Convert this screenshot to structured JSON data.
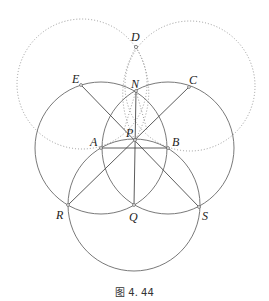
{
  "figure": {
    "caption": "图 4. 44",
    "points": {
      "D": {
        "label": "D",
        "x": 136,
        "y": 47
      },
      "E": {
        "label": "E",
        "x": 81,
        "y": 85
      },
      "N": {
        "label": "N",
        "x": 136,
        "y": 91
      },
      "C": {
        "label": "C",
        "x": 189,
        "y": 87
      },
      "P": {
        "label": "P",
        "x": 135,
        "y": 140
      },
      "A": {
        "label": "A",
        "x": 101,
        "y": 148
      },
      "B": {
        "label": "B",
        "x": 168,
        "y": 148
      },
      "R": {
        "label": "R",
        "x": 68,
        "y": 205
      },
      "Q": {
        "label": "Q",
        "x": 134,
        "y": 205
      },
      "S": {
        "label": "S",
        "x": 199,
        "y": 207
      }
    },
    "solid_circles": [
      {
        "center": "A",
        "r": 66
      },
      {
        "center": "B",
        "r": 66
      },
      {
        "center": "Q",
        "r": 66
      }
    ],
    "dotted_circles": [
      {
        "center": "E",
        "r": 65
      },
      {
        "center": "C",
        "r": 65
      }
    ],
    "segments": [
      [
        "E",
        "S"
      ],
      [
        "C",
        "R"
      ],
      [
        "N",
        "Q"
      ],
      [
        "A",
        "B"
      ]
    ]
  }
}
